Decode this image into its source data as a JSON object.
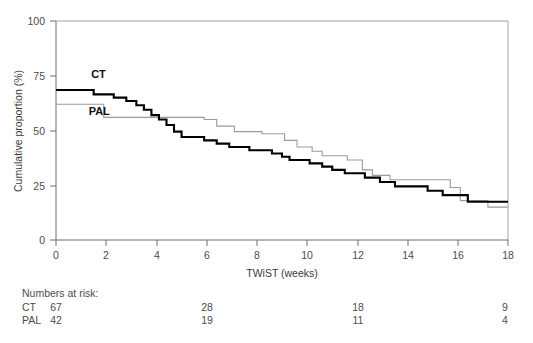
{
  "chart_data": {
    "type": "line",
    "title": "",
    "xlabel": "TWiST (weeks)",
    "ylabel": "Cumulative proportion (%)",
    "xlim": [
      0,
      18
    ],
    "ylim": [
      0,
      100
    ],
    "xticks": [
      0,
      2,
      4,
      6,
      8,
      10,
      12,
      14,
      16,
      18
    ],
    "yticks": [
      0,
      25,
      50,
      75,
      100
    ],
    "xtick_labels": [
      "0",
      "2",
      "4",
      "6",
      "8",
      "10",
      "12",
      "14",
      "16",
      "18"
    ],
    "ytick_labels": [
      "0",
      "25",
      "50",
      "75",
      "100"
    ],
    "grid": false,
    "legend_position": "inline-on-curves",
    "series": [
      {
        "name": "CT",
        "style": "solid-thick-black",
        "color": "#000000",
        "label_x": 1.4,
        "label_y": 74,
        "steps": [
          [
            0.0,
            68.5
          ],
          [
            1.5,
            68.5
          ],
          [
            1.5,
            66.5
          ],
          [
            2.3,
            66.5
          ],
          [
            2.3,
            65.0
          ],
          [
            2.8,
            65.0
          ],
          [
            2.8,
            63.5
          ],
          [
            3.2,
            63.5
          ],
          [
            3.2,
            61.5
          ],
          [
            3.5,
            61.5
          ],
          [
            3.5,
            59.5
          ],
          [
            3.8,
            59.5
          ],
          [
            3.8,
            57.0
          ],
          [
            4.1,
            57.0
          ],
          [
            4.1,
            55.0
          ],
          [
            4.4,
            55.0
          ],
          [
            4.4,
            52.5
          ],
          [
            4.7,
            52.5
          ],
          [
            4.7,
            49.5
          ],
          [
            5.0,
            49.5
          ],
          [
            5.0,
            47.0
          ],
          [
            5.9,
            47.0
          ],
          [
            5.9,
            45.5
          ],
          [
            6.4,
            45.5
          ],
          [
            6.4,
            44.0
          ],
          [
            6.9,
            44.0
          ],
          [
            6.9,
            42.5
          ],
          [
            7.7,
            42.5
          ],
          [
            7.7,
            41.0
          ],
          [
            8.6,
            41.0
          ],
          [
            8.6,
            39.5
          ],
          [
            9.0,
            39.5
          ],
          [
            9.0,
            38.0
          ],
          [
            9.3,
            38.0
          ],
          [
            9.3,
            36.5
          ],
          [
            10.1,
            36.5
          ],
          [
            10.1,
            35.0
          ],
          [
            10.6,
            35.0
          ],
          [
            10.6,
            33.5
          ],
          [
            11.0,
            33.5
          ],
          [
            11.0,
            32.0
          ],
          [
            11.5,
            32.0
          ],
          [
            11.5,
            30.5
          ],
          [
            12.3,
            30.5
          ],
          [
            12.3,
            28.5
          ],
          [
            12.9,
            28.5
          ],
          [
            12.9,
            26.5
          ],
          [
            13.5,
            26.5
          ],
          [
            13.5,
            24.5
          ],
          [
            14.8,
            24.5
          ],
          [
            14.8,
            22.5
          ],
          [
            15.4,
            22.5
          ],
          [
            15.4,
            20.5
          ],
          [
            16.4,
            20.5
          ],
          [
            16.4,
            17.5
          ],
          [
            18.0,
            17.5
          ]
        ]
      },
      {
        "name": "PAL",
        "style": "solid-thin-grey",
        "color": "#9b9b9b",
        "label_x": 1.3,
        "label_y": 57,
        "steps": [
          [
            0.0,
            62.0
          ],
          [
            1.9,
            62.0
          ],
          [
            1.9,
            56.0
          ],
          [
            5.9,
            56.0
          ],
          [
            5.9,
            55.0
          ],
          [
            6.4,
            55.0
          ],
          [
            6.4,
            52.0
          ],
          [
            7.1,
            52.0
          ],
          [
            7.1,
            49.5
          ],
          [
            8.2,
            49.5
          ],
          [
            8.2,
            48.5
          ],
          [
            9.1,
            48.5
          ],
          [
            9.1,
            45.5
          ],
          [
            9.6,
            45.5
          ],
          [
            9.6,
            42.5
          ],
          [
            10.2,
            42.5
          ],
          [
            10.2,
            40.5
          ],
          [
            10.6,
            40.5
          ],
          [
            10.6,
            38.5
          ],
          [
            11.6,
            38.5
          ],
          [
            11.6,
            36.5
          ],
          [
            12.2,
            36.5
          ],
          [
            12.2,
            32.0
          ],
          [
            12.6,
            32.0
          ],
          [
            12.6,
            29.5
          ],
          [
            13.3,
            29.5
          ],
          [
            13.3,
            27.5
          ],
          [
            15.7,
            27.5
          ],
          [
            15.7,
            24.0
          ],
          [
            16.1,
            24.0
          ],
          [
            16.1,
            18.0
          ],
          [
            17.2,
            18.0
          ],
          [
            17.2,
            15.0
          ],
          [
            18.0,
            15.0
          ]
        ]
      }
    ],
    "numbers_at_risk": {
      "heading": "Numbers at risk:",
      "columns": [
        0,
        6,
        12,
        18
      ],
      "rows": [
        {
          "label": "CT",
          "values": [
            "67",
            "28",
            "18",
            "9"
          ]
        },
        {
          "label": "PAL",
          "values": [
            "42",
            "19",
            "11",
            "4"
          ]
        }
      ]
    },
    "colors": {
      "ct": "#000000",
      "pal": "#9b9b9b",
      "axis": "#6f6f6f",
      "frame": "#9a9a9a",
      "text": "#4d4d4d",
      "background": "#ffffff"
    }
  }
}
